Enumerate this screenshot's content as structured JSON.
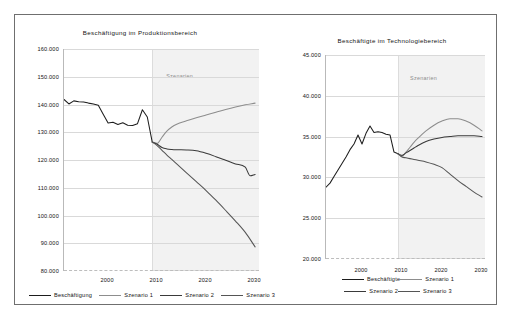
{
  "figure": {
    "background": "#ffffff",
    "frame_color": "#6f6f6f"
  },
  "charts": [
    {
      "id": "produktionsbereich",
      "title": "Beschäftigung im Produktionsbereich",
      "shade_label": "Szenarien",
      "legend": [
        {
          "label": "Beschäftigung",
          "color": "#1d1d1d"
        },
        {
          "label": "Szenario 1",
          "color": "#8d8d8d"
        },
        {
          "label": "Szenario 2",
          "color": "#3a3a3a"
        },
        {
          "label": "Szenario 3",
          "color": "#555555"
        }
      ],
      "yticks": [
        "160.000",
        "150.000",
        "140.000",
        "130.000",
        "120.000",
        "110.000",
        "100.000",
        "90.000",
        "80.000"
      ],
      "xticks": [
        "2000",
        "2010",
        "2020",
        "2030"
      ]
    },
    {
      "id": "technologiebereich",
      "title": "Beschäftigte im Technologiebereich",
      "shade_label": "Szenarien",
      "legend": [
        {
          "label": "Beschäftigte",
          "color": "#1d1d1d"
        },
        {
          "label": "Szenario 1",
          "color": "#8d8d8d"
        },
        {
          "label": "Szenario 2",
          "color": "#3a3a3a"
        },
        {
          "label": "Szenario 3",
          "color": "#555555"
        }
      ],
      "yticks": [
        "45.000",
        "40.000",
        "35.000",
        "30.000",
        "25.000",
        "20.000"
      ],
      "xticks": [
        "2000",
        "2010",
        "2020",
        "2030"
      ]
    }
  ],
  "chart_data": [
    {
      "type": "line",
      "title": "Beschäftigung im Produktionsbereich",
      "xlabel": "",
      "ylabel": "",
      "xlim": [
        1991,
        2031
      ],
      "ylim": [
        80000,
        160000
      ],
      "ytick_values": [
        80000,
        90000,
        100000,
        110000,
        120000,
        130000,
        140000,
        150000,
        160000
      ],
      "xtick_values": [
        2000,
        2010,
        2020,
        2030
      ],
      "grid": true,
      "legend_position": "below-figure",
      "annotations": [
        {
          "text": "Szenarien",
          "x_range": [
            2009,
            2031
          ]
        }
      ],
      "series": [
        {
          "name": "Beschäftigung",
          "color": "#1d1d1d",
          "x": [
            1991,
            1992,
            1993,
            1994,
            1995,
            1996,
            1997,
            1998,
            1999,
            2000,
            2001,
            2002,
            2003,
            2004,
            2005,
            2006,
            2007,
            2008,
            2009
          ],
          "values": [
            141800,
            140200,
            141300,
            141000,
            140900,
            140500,
            140200,
            139700,
            136500,
            133300,
            133600,
            132800,
            133400,
            132500,
            132400,
            133100,
            138100,
            135500,
            126500
          ]
        },
        {
          "name": "Szenario 1",
          "color": "#8d8d8d",
          "x": [
            2009,
            2010,
            2011,
            2012,
            2013,
            2014,
            2016,
            2018,
            2020,
            2022,
            2024,
            2026,
            2028,
            2030
          ],
          "values": [
            126500,
            126000,
            128200,
            130400,
            131900,
            132900,
            134100,
            135200,
            136200,
            137200,
            138200,
            139100,
            139900,
            140500
          ]
        },
        {
          "name": "Szenario 2",
          "color": "#3a3a3a",
          "x": [
            2009,
            2010,
            2011,
            2012,
            2013,
            2014,
            2016,
            2018,
            2020,
            2022,
            2024,
            2026,
            2028,
            2029,
            2030
          ],
          "values": [
            126500,
            125700,
            124500,
            124000,
            123800,
            123700,
            123600,
            123300,
            122400,
            121200,
            119900,
            118600,
            117400,
            114300,
            114800
          ]
        },
        {
          "name": "Szenario 3",
          "color": "#555555",
          "x": [
            2009,
            2010,
            2011,
            2012,
            2013,
            2014,
            2016,
            2018,
            2020,
            2022,
            2024,
            2026,
            2028,
            2030
          ],
          "values": [
            126500,
            125200,
            123500,
            121800,
            120200,
            118600,
            115400,
            112200,
            109000,
            105500,
            101800,
            98000,
            93900,
            88700
          ]
        }
      ]
    },
    {
      "type": "line",
      "title": "Beschäftigte im Technologiebereich",
      "xlabel": "",
      "ylabel": "",
      "xlim": [
        1991,
        2031
      ],
      "ylim": [
        20000,
        45000
      ],
      "ytick_values": [
        20000,
        25000,
        30000,
        35000,
        40000,
        45000
      ],
      "xtick_values": [
        2000,
        2010,
        2020,
        2030
      ],
      "grid": true,
      "legend_position": "below-axes",
      "annotations": [
        {
          "text": "Szenarien",
          "x_range": [
            2009,
            2031
          ]
        }
      ],
      "series": [
        {
          "name": "Beschäftigte",
          "color": "#1d1d1d",
          "x": [
            1991,
            1992,
            1993,
            1994,
            1995,
            1996,
            1997,
            1998,
            1999,
            2000,
            2001,
            2002,
            2003,
            2004,
            2005,
            2006,
            2007,
            2008,
            2009
          ],
          "values": [
            28800,
            29300,
            30100,
            30900,
            31700,
            32500,
            33400,
            34100,
            35200,
            34100,
            35400,
            36300,
            35500,
            35600,
            35500,
            35300,
            35200,
            33100,
            32900
          ]
        },
        {
          "name": "Szenario 1",
          "color": "#8d8d8d",
          "x": [
            2009,
            2010,
            2011,
            2012,
            2013,
            2014,
            2016,
            2018,
            2020,
            2022,
            2024,
            2026,
            2028,
            2030
          ],
          "values": [
            32900,
            32600,
            33100,
            33700,
            34300,
            34800,
            35700,
            36400,
            36900,
            37200,
            37200,
            36900,
            36400,
            35700
          ]
        },
        {
          "name": "Szenario 2",
          "color": "#3a3a3a",
          "x": [
            2009,
            2010,
            2011,
            2012,
            2013,
            2014,
            2016,
            2018,
            2020,
            2022,
            2024,
            2026,
            2028,
            2030
          ],
          "values": [
            32900,
            32700,
            33000,
            33300,
            33600,
            33900,
            34400,
            34700,
            34900,
            35000,
            35100,
            35100,
            35100,
            35000
          ]
        },
        {
          "name": "Szenario 3",
          "color": "#555555",
          "x": [
            2009,
            2010,
            2011,
            2012,
            2013,
            2014,
            2016,
            2018,
            2020,
            2022,
            2024,
            2026,
            2028,
            2030
          ],
          "values": [
            32900,
            32500,
            32400,
            32300,
            32200,
            32100,
            31900,
            31600,
            31200,
            30400,
            29600,
            28900,
            28200,
            27600
          ]
        }
      ]
    }
  ]
}
